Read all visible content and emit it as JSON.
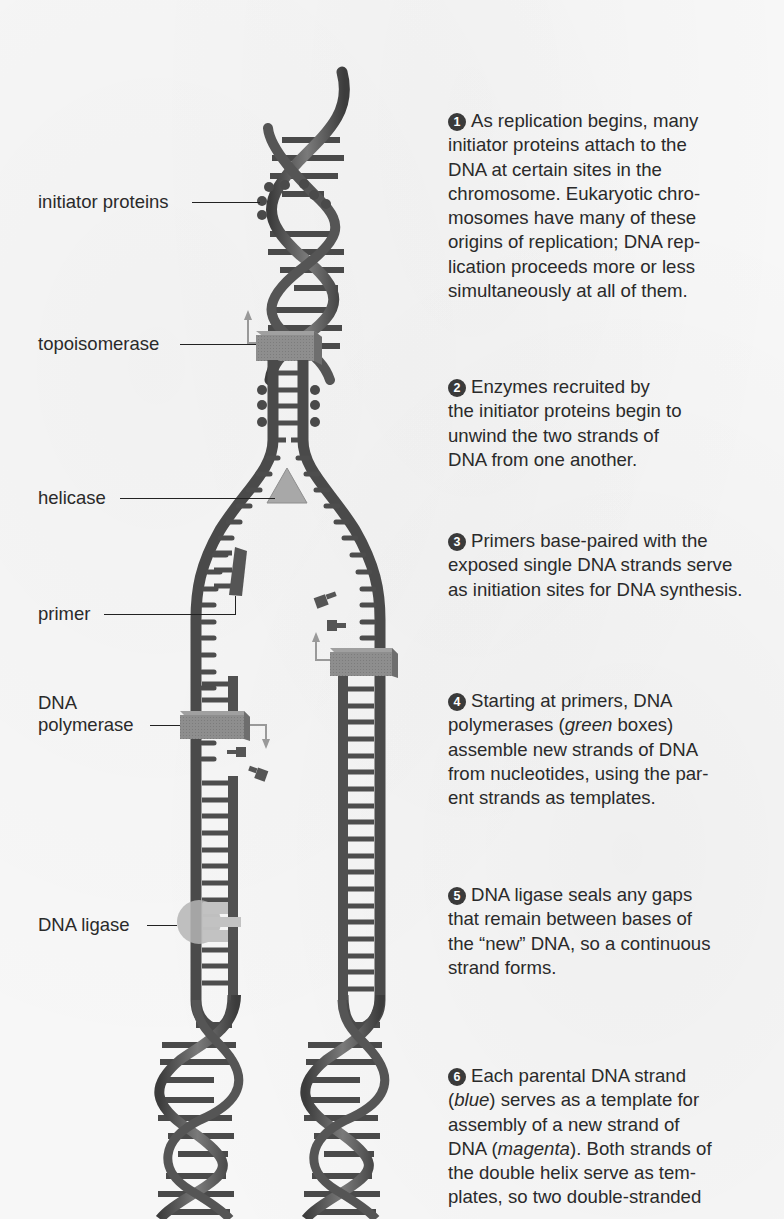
{
  "figure": {
    "type": "diagram",
    "colors": {
      "strand": "#4a4a4a",
      "rung": "#4d4d4d",
      "topoisomerase": "#8a8a8a",
      "helicase": "#a8a8a8",
      "primer": "#555555",
      "polymerase": "#8c8c8c",
      "ligase": "#b5b5b5",
      "arrow": "#9a9a9a",
      "text": "#2a2a2a",
      "badge": "#3a3a3a"
    }
  },
  "labels": {
    "initiator_proteins": "initiator proteins",
    "topoisomerase": "topoisomerase",
    "helicase": "helicase",
    "primer": "primer",
    "dna_polymerase_line1": "DNA",
    "dna_polymerase_line2": "polymerase",
    "dna_ligase": "DNA ligase"
  },
  "steps": [
    {
      "number": "1",
      "lines": [
        "As replication begins, many",
        "initiator proteins attach to the",
        "DNA at certain sites in the",
        "chromosome. Eukaryotic chro-",
        "mosomes have many of these",
        "origins of replication; DNA rep-",
        "lication proceeds more or less",
        "simultaneously at all of them."
      ]
    },
    {
      "number": "2",
      "lines": [
        "Enzymes recruited by",
        "the initiator proteins begin to",
        "unwind the two strands of",
        "DNA from one another."
      ]
    },
    {
      "number": "3",
      "lines": [
        "Primers base-paired with the",
        "exposed single DNA strands serve",
        "as initiation sites for DNA synthesis."
      ]
    },
    {
      "number": "4",
      "line1": "Starting at primers, DNA",
      "line2_pre": "polymerases (",
      "line2_em": "green",
      "line2_post": " boxes)",
      "line3": "assemble new strands of DNA",
      "line4": "from nucleotides, using the par-",
      "line5": "ent strands as templates."
    },
    {
      "number": "5",
      "lines": [
        "DNA ligase seals any gaps",
        "that remain between bases of",
        "the “new” DNA, so a continuous",
        "strand forms."
      ]
    },
    {
      "number": "6",
      "line1": "Each parental DNA strand",
      "line2_pre": "(",
      "line2_em": "blue",
      "line2_post": ") serves as a template for",
      "line3": "assembly of a new strand of",
      "line4_pre": "DNA (",
      "line4_em": "magenta",
      "line4_post": "). Both strands of",
      "line5": "the double helix serve as tem-",
      "line6": "plates, so two double-stranded"
    }
  ]
}
